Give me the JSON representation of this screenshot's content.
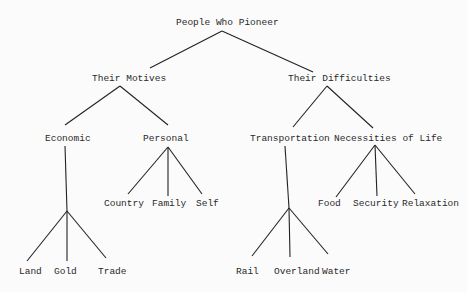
{
  "diagram": {
    "type": "tree",
    "root": "People Who Pioneer",
    "nodes": {
      "root": "People Who Pioneer",
      "motives": "Their Motives",
      "difficulties": "Their Difficulties",
      "economic": "Economic",
      "personal": "Personal",
      "transportation": "Transportation",
      "necessities": "Necessities of Life",
      "land": "Land",
      "gold": "Gold",
      "trade": "Trade",
      "country": "Country",
      "family": "Family",
      "self": "Self",
      "rail": "Rail",
      "overland": "Overland",
      "water": "Water",
      "food": "Food",
      "security": "Security",
      "relaxation": "Relaxation"
    },
    "edges": [
      [
        "People Who Pioneer",
        "Their Motives"
      ],
      [
        "People Who Pioneer",
        "Their Difficulties"
      ],
      [
        "Their Motives",
        "Economic"
      ],
      [
        "Their Motives",
        "Personal"
      ],
      [
        "Their Difficulties",
        "Transportation"
      ],
      [
        "Their Difficulties",
        "Necessities of Life"
      ],
      [
        "Economic",
        "Land"
      ],
      [
        "Economic",
        "Gold"
      ],
      [
        "Economic",
        "Trade"
      ],
      [
        "Personal",
        "Country"
      ],
      [
        "Personal",
        "Family"
      ],
      [
        "Personal",
        "Self"
      ],
      [
        "Transportation",
        "Rail"
      ],
      [
        "Transportation",
        "Overland"
      ],
      [
        "Transportation",
        "Water"
      ],
      [
        "Necessities of Life",
        "Food"
      ],
      [
        "Necessities of Life",
        "Security"
      ],
      [
        "Necessities of Life",
        "Relaxation"
      ]
    ]
  }
}
